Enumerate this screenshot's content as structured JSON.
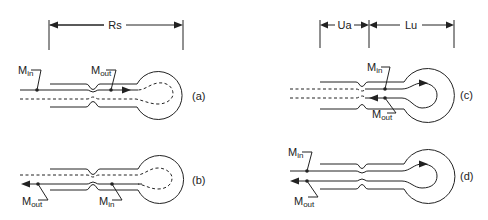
{
  "figure": {
    "panels": [
      {
        "id": "a",
        "label": "(a)",
        "markers": {
          "in": {
            "base": "M",
            "sub": "in"
          },
          "out": {
            "base": "M",
            "sub": "out"
          }
        },
        "dimension": "Rs"
      },
      {
        "id": "b",
        "label": "(b)",
        "markers": {
          "in": {
            "base": "M",
            "sub": "in"
          },
          "out": {
            "base": "M",
            "sub": "out"
          }
        }
      },
      {
        "id": "c",
        "label": "(c)",
        "markers": {
          "in": {
            "base": "M",
            "sub": "in"
          },
          "out": {
            "base": "M",
            "sub": "out"
          }
        },
        "dimensions": [
          "Ua",
          "Lu"
        ]
      },
      {
        "id": "d",
        "label": "(d)",
        "markers": {
          "in": {
            "base": "M",
            "sub": "in"
          },
          "out": {
            "base": "M",
            "sub": "out"
          }
        }
      }
    ],
    "colors": {
      "stroke": "#222222",
      "background": "#ffffff"
    }
  }
}
